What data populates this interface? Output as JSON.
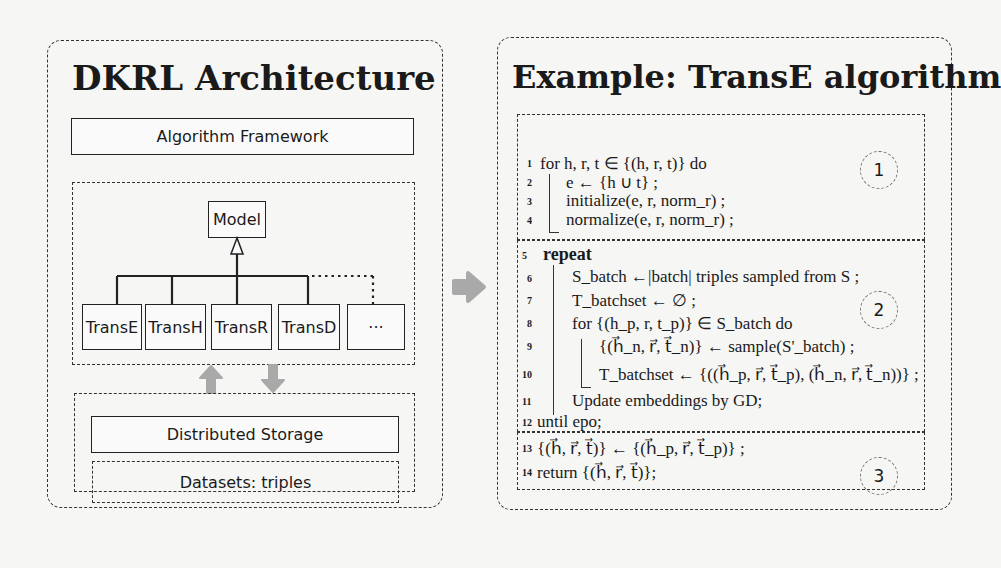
{
  "left_panel": {
    "title": "DKRL Architecture",
    "framework_label": "Algorithm Framework",
    "model_label": "Model",
    "subclasses": [
      "TransE",
      "TransH",
      "TransR",
      "TransD",
      "···"
    ],
    "storage_label": "Distributed Storage",
    "datasets_label": "Datasets: triples"
  },
  "right_panel": {
    "title": "Example: TransE algorithm",
    "circles": [
      "1",
      "2",
      "3"
    ],
    "lines": [
      {
        "n": "1",
        "text": "for h, r, t ∈ {(h, r, t)} do"
      },
      {
        "n": "2",
        "text": "e ← {h ∪ t} ;"
      },
      {
        "n": "3",
        "text": "initialize(e, r, norm_r) ;"
      },
      {
        "n": "4",
        "text": "normalize(e, r, norm_r) ;"
      },
      {
        "n": "5",
        "text": "repeat"
      },
      {
        "n": "6",
        "text": "S_batch ←|batch| triples sampled from S ;"
      },
      {
        "n": "7",
        "text": "T_batchset ← ∅ ;"
      },
      {
        "n": "8",
        "text": "for {(h_p, r, t_p)} ∈ S_batch do"
      },
      {
        "n": "9",
        "text": "{(h⃗_n, r⃗, t⃗_n)} ← sample(S'_batch) ;"
      },
      {
        "n": "10",
        "text": "T_batchset ← {((h⃗_p, r⃗, t⃗_p), (h⃗_n, r⃗, t⃗_n))} ;"
      },
      {
        "n": "11",
        "text": "Update embeddings by GD;"
      },
      {
        "n": "12",
        "text": "until epo;"
      },
      {
        "n": "13",
        "text": "{(h⃗, r⃗, t⃗)} ← {(h⃗_p, r⃗, t⃗_p)} ;"
      },
      {
        "n": "14",
        "text": "return {(h⃗, r⃗, t⃗)};"
      }
    ]
  },
  "colors": {
    "arrow": "#a9a9a9",
    "border": "#333333",
    "background": "#f6f6f4"
  }
}
